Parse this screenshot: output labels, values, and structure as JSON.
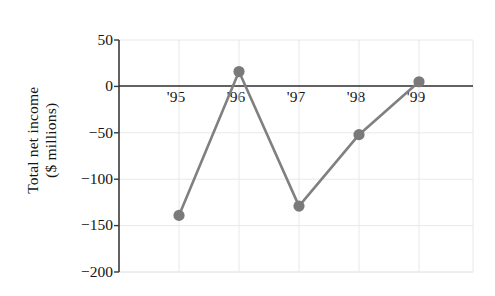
{
  "chart_data": {
    "type": "line",
    "title": "",
    "xlabel": "",
    "ylabel": "Total net income ($ millions)",
    "ylabel_line1": "Total net income",
    "ylabel_line2": "($ millions)",
    "categories": [
      "'95",
      "'96",
      "'97",
      "'98",
      "'99"
    ],
    "values": [
      -139,
      16,
      -129,
      -52,
      5
    ],
    "series": [
      {
        "name": "Total net income",
        "values": [
          -139,
          16,
          -129,
          -52,
          5
        ]
      }
    ],
    "ylim": [
      -200,
      50
    ],
    "yticks": [
      50,
      0,
      -50,
      -100,
      -150,
      -200
    ],
    "ytick_labels": [
      "50",
      "0",
      "−50",
      "−100",
      "−150",
      "−200"
    ],
    "xtick_labels": [
      "'95",
      "'96",
      "'97",
      "'98",
      "'99"
    ],
    "grid": true,
    "grid_color": "#e8e8ea",
    "legend": "none",
    "line_color": "#808080",
    "marker_color": "#7a7a7a",
    "marker_shape": "circle",
    "axis_color": "#3a3a3a",
    "zero_line": 0
  },
  "figure": {
    "background": "#ffffff",
    "text_color": "#141414"
  }
}
